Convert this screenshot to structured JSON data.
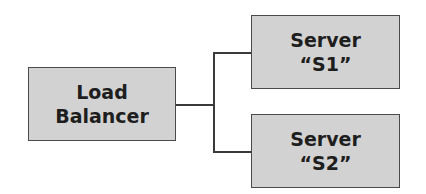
{
  "diagram": {
    "type": "tree",
    "nodes": [
      {
        "id": "lb",
        "line1": "Load",
        "line2": "Balancer"
      },
      {
        "id": "s1",
        "line1": "Server",
        "line2": "“S1”"
      },
      {
        "id": "s2",
        "line1": "Server",
        "line2": "“S2”"
      }
    ],
    "edges": [
      {
        "from": "lb",
        "to": "s1"
      },
      {
        "from": "lb",
        "to": "s2"
      }
    ],
    "colors": {
      "box_fill": "#d2d2d2",
      "box_border": "#4a4a4a",
      "text": "#1e1e1e",
      "line": "#3a3a3a"
    }
  }
}
